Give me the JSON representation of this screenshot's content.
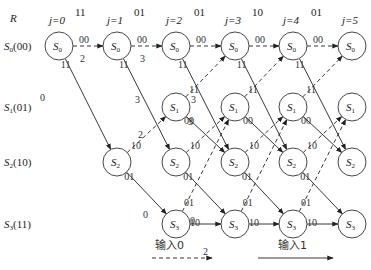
{
  "row_header": "R",
  "columns": [
    {
      "label": "j=0",
      "x": 59
    },
    {
      "label": "j=1",
      "x": 117
    },
    {
      "label": "j=2",
      "x": 176
    },
    {
      "label": "j=3",
      "x": 235
    },
    {
      "label": "j=4",
      "x": 293
    },
    {
      "label": "j=5",
      "x": 352
    }
  ],
  "received": [
    {
      "value": "11",
      "x": 80
    },
    {
      "value": "01",
      "x": 139
    },
    {
      "value": "01",
      "x": 199
    },
    {
      "value": "10",
      "x": 257
    },
    {
      "value": "01",
      "x": 316
    }
  ],
  "states": [
    {
      "label": "S0(00)",
      "sub": "0",
      "code": "(00)",
      "y": 46
    },
    {
      "label": "S1(01)",
      "sub": "1",
      "code": "(01)",
      "y": 107
    },
    {
      "label": "S2(10)",
      "sub": "2",
      "code": "(10)",
      "y": 162
    },
    {
      "label": "S3(11)",
      "sub": "3",
      "code": "(11)",
      "y": 224
    }
  ],
  "nodes": [
    {
      "col": 0,
      "state": 0
    },
    {
      "col": 1,
      "state": 0
    },
    {
      "col": 1,
      "state": 2
    },
    {
      "col": 2,
      "state": 0
    },
    {
      "col": 2,
      "state": 1
    },
    {
      "col": 2,
      "state": 2
    },
    {
      "col": 2,
      "state": 3
    },
    {
      "col": 3,
      "state": 0
    },
    {
      "col": 3,
      "state": 1
    },
    {
      "col": 3,
      "state": 2
    },
    {
      "col": 3,
      "state": 3
    },
    {
      "col": 4,
      "state": 0
    },
    {
      "col": 4,
      "state": 1
    },
    {
      "col": 4,
      "state": 2
    },
    {
      "col": 4,
      "state": 3
    },
    {
      "col": 5,
      "state": 0
    },
    {
      "col": 5,
      "state": 1
    },
    {
      "col": 5,
      "state": 2
    },
    {
      "col": 5,
      "state": 3
    }
  ],
  "metrics": [
    {
      "text": "2",
      "x": 80,
      "y": 62
    },
    {
      "text": "0",
      "x": 40,
      "y": 101
    },
    {
      "text": "3",
      "x": 140,
      "y": 62
    },
    {
      "text": "3",
      "x": 135,
      "y": 103
    },
    {
      "text": "3",
      "x": 191,
      "y": 103
    },
    {
      "text": "3",
      "x": 188,
      "y": 125
    },
    {
      "text": "2",
      "x": 138,
      "y": 138
    },
    {
      "text": "0",
      "x": 143,
      "y": 218
    },
    {
      "text": "0",
      "x": 190,
      "y": 224
    },
    {
      "text": "2",
      "x": 203,
      "y": 255
    }
  ],
  "legend": {
    "input0": "输入0",
    "input1": "输入1"
  }
}
